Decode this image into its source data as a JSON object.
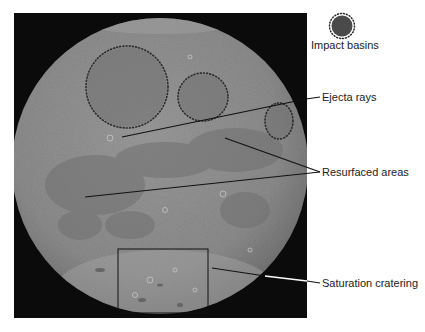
{
  "figure": {
    "type": "annotated lunar surface diagram",
    "background": "#ffffff",
    "frame_color": "#0a0a0a",
    "moon_color": "#8a8a8a"
  },
  "legend": {
    "symbol": "dotted-circle-basin",
    "label": "Impact basins"
  },
  "annotations": [
    {
      "id": "ejecta",
      "label": "Ejecta rays"
    },
    {
      "id": "resurfaced",
      "label": "Resurfaced areas"
    },
    {
      "id": "saturation",
      "label": "Saturation cratering"
    }
  ],
  "basins": [
    {
      "name": "large-basin",
      "cx": 127,
      "cy": 87,
      "rx": 41,
      "ry": 41
    },
    {
      "name": "middle-basin",
      "cx": 203,
      "cy": 97,
      "rx": 25,
      "ry": 24
    },
    {
      "name": "small-basin",
      "cx": 279,
      "cy": 121,
      "rx": 14,
      "ry": 18
    }
  ]
}
